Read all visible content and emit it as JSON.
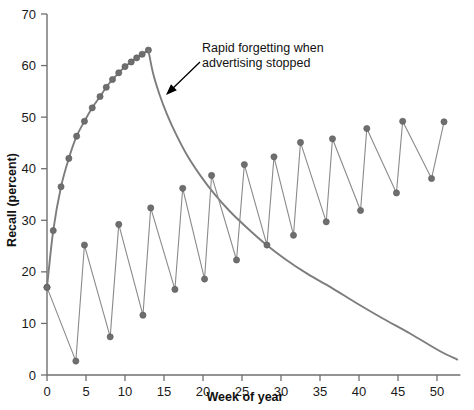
{
  "chart_data": {
    "type": "line",
    "title": "",
    "xlabel": "Week of year",
    "ylabel": "Recall (percent)",
    "xlim": [
      0,
      53
    ],
    "ylim": [
      0,
      70
    ],
    "xticks": [
      0,
      5,
      10,
      15,
      20,
      25,
      30,
      35,
      40,
      45,
      50
    ],
    "yticks": [
      0,
      10,
      20,
      30,
      40,
      50,
      60,
      70
    ],
    "grid": false,
    "legend": "none",
    "marker_color": "#6e6e6e",
    "line_color": "#8a8a8a",
    "curve_color": "#7d7d7d",
    "series": [
      {
        "name": "Continuous advertising then stopped",
        "has_markers": true,
        "x": [
          0,
          0.8,
          1.8,
          2.8,
          3.8,
          4.8,
          5.8,
          6.8,
          7.6,
          8.4,
          9.2,
          10.0,
          10.8,
          11.5,
          12.2,
          13.0
        ],
        "values": [
          17,
          28,
          36.5,
          42,
          46.3,
          49.2,
          51.8,
          54,
          55.8,
          57.3,
          58.6,
          59.8,
          60.7,
          61.5,
          62.2,
          63
        ]
      },
      {
        "name": "Forgetting decay after advertising stopped",
        "has_markers": false,
        "x": [
          13.0,
          13.6,
          14.4,
          15.4,
          16.6,
          18.0,
          19.6,
          21.4,
          23.4,
          25.6,
          28.0,
          30.6,
          33.4,
          36.4,
          39.6,
          43.0,
          46.6,
          50.4,
          52.6
        ],
        "values": [
          63,
          58.5,
          54.5,
          50.5,
          46.5,
          42.5,
          38.8,
          35.2,
          31.8,
          28.6,
          25.4,
          22.4,
          19.6,
          17.0,
          14.0,
          11.0,
          8.0,
          4.6,
          3.0
        ]
      },
      {
        "name": "Pulsed (flighted) advertising",
        "has_markers": true,
        "x": [
          0,
          3.7,
          4.8,
          8.1,
          9.2,
          12.3,
          13.3,
          16.4,
          17.4,
          20.2,
          21.1,
          24.3,
          25.3,
          28.2,
          29.1,
          31.6,
          32.5,
          35.8,
          36.6,
          40.2,
          41.0,
          44.8,
          45.6,
          49.3,
          50.9
        ],
        "values": [
          17,
          2.7,
          25.2,
          7.4,
          29.2,
          11.6,
          32.4,
          16.6,
          36.2,
          18.6,
          38.7,
          22.3,
          40.8,
          25.2,
          42.3,
          27.1,
          45.1,
          29.7,
          45.8,
          31.9,
          47.8,
          35.3,
          49.2,
          38.1,
          49.1
        ]
      }
    ],
    "annotations": [
      {
        "name": "rapid-forgetting-note",
        "lines": [
          "Rapid forgetting when",
          "advertising stopped"
        ],
        "text_x": 202,
        "text_y": 52,
        "arrow_from_x": 200,
        "arrow_from_y": 62,
        "arrow_to_x": 166,
        "arrow_to_y": 95
      }
    ]
  }
}
